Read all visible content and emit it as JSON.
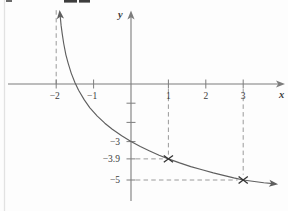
{
  "figure": {
    "background": "#fdfdfd",
    "axis_color": "#7d7d7d",
    "curve_color": "#5f5f5f",
    "dash_color": "#9a9a9a",
    "text_color": "#3c3c3c",
    "marker_color": "#333333",
    "x_axis_label": "x",
    "y_axis_label": "y"
  },
  "chart_data": {
    "type": "line",
    "title": "",
    "xlabel": "x",
    "ylabel": "y",
    "xlim": [
      -3.3,
      4.1
    ],
    "ylim": [
      -6.6,
      3.9
    ],
    "grid": false,
    "x_ticks": [
      {
        "value": -2,
        "label": "−2"
      },
      {
        "value": -1,
        "label": "−1"
      },
      {
        "value": 1,
        "label": "1"
      },
      {
        "value": 2,
        "label": "2"
      },
      {
        "value": 3,
        "label": "3"
      }
    ],
    "y_ticks": [
      {
        "value": -1,
        "label": ""
      },
      {
        "value": -2,
        "label": ""
      },
      {
        "value": -3,
        "label": "−3"
      },
      {
        "value": -3.9,
        "label": "−3.9"
      },
      {
        "value": -5,
        "label": "−5"
      }
    ],
    "vertical_asymptote_x": -2,
    "y_intercept": {
      "x": 0,
      "y": -3
    },
    "marked_points": [
      {
        "x": 1,
        "y": -3.9,
        "marker": "×"
      },
      {
        "x": 3,
        "y": -5,
        "marker": "×"
      }
    ],
    "guides": [
      {
        "orientation": "vertical",
        "at_x": -2,
        "y_from": 0,
        "y_to": 3.85,
        "role": "asymptote-guide"
      },
      {
        "orientation": "vertical",
        "at_x": 1,
        "y_from": -0.26,
        "y_to": -3.68,
        "role": "point-guide"
      },
      {
        "orientation": "vertical",
        "at_x": 3,
        "y_from": -0.26,
        "y_to": -4.72,
        "role": "point-guide"
      },
      {
        "orientation": "horizontal",
        "at_y": -3.9,
        "x_from": 0.13,
        "x_to": 0.85,
        "role": "point-guide"
      },
      {
        "orientation": "horizontal",
        "at_y": -5,
        "x_from": 0.13,
        "x_to": 2.85,
        "role": "point-guide"
      }
    ],
    "curve_points": [
      [
        -1.902,
        3.7
      ],
      [
        -1.87,
        3.05
      ],
      [
        -1.84,
        2.62
      ],
      [
        -1.8,
        2.11
      ],
      [
        -1.74,
        1.52
      ],
      [
        -1.68,
        1.08
      ],
      [
        -1.6,
        0.57
      ],
      [
        -1.5,
        0.08
      ],
      [
        -1.4,
        -0.33
      ],
      [
        -1.25,
        -0.83
      ],
      [
        -1.1,
        -1.24
      ],
      [
        -0.9,
        -1.67
      ],
      [
        -0.7,
        -2.04
      ],
      [
        -0.5,
        -2.36
      ],
      [
        -0.25,
        -2.7
      ],
      [
        0.0,
        -3.0
      ],
      [
        0.25,
        -3.26
      ],
      [
        0.5,
        -3.49
      ],
      [
        0.75,
        -3.71
      ],
      [
        1.0,
        -3.9
      ],
      [
        1.3,
        -4.11
      ],
      [
        1.6,
        -4.3
      ],
      [
        1.9,
        -4.47
      ],
      [
        2.2,
        -4.63
      ],
      [
        2.5,
        -4.77
      ],
      [
        2.75,
        -4.89
      ],
      [
        3.0,
        -5.0
      ],
      [
        3.3,
        -5.08
      ],
      [
        3.55,
        -5.14
      ],
      [
        3.8,
        -5.19
      ]
    ]
  }
}
